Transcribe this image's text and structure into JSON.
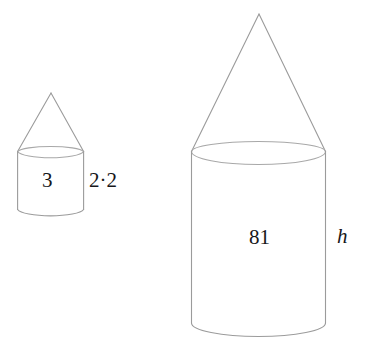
{
  "figure": {
    "background_color": "#ffffff",
    "stroke_color": "#9b9b9b",
    "text_color": "#17171a",
    "shapes": [
      {
        "name": "small-solid",
        "description": "small cone mounted on small cylinder",
        "cone": {
          "apex_x": 51,
          "apex_y": 93,
          "base_y": 152,
          "base_left_x": 17,
          "base_right_x": 84
        },
        "cylinder": {
          "left_x": 17,
          "right_x": 84,
          "top_y": 152,
          "bottom_y": 216,
          "ellipse_ry": 7
        },
        "labels": {
          "radius": "3",
          "height": "2·2"
        }
      },
      {
        "name": "large-solid",
        "description": "large cone mounted on large cylinder",
        "cone": {
          "apex_x": 259,
          "apex_y": 14,
          "base_y": 152,
          "base_left_x": 191,
          "base_right_x": 326
        },
        "cylinder": {
          "left_x": 191,
          "right_x": 326,
          "top_y": 152,
          "bottom_y": 337,
          "ellipse_ry": 13
        },
        "labels": {
          "radius": "81",
          "height": "h"
        }
      }
    ]
  },
  "labels": {
    "small_radius": "3",
    "small_height": "2·2",
    "large_radius": "81",
    "large_height": "h"
  }
}
